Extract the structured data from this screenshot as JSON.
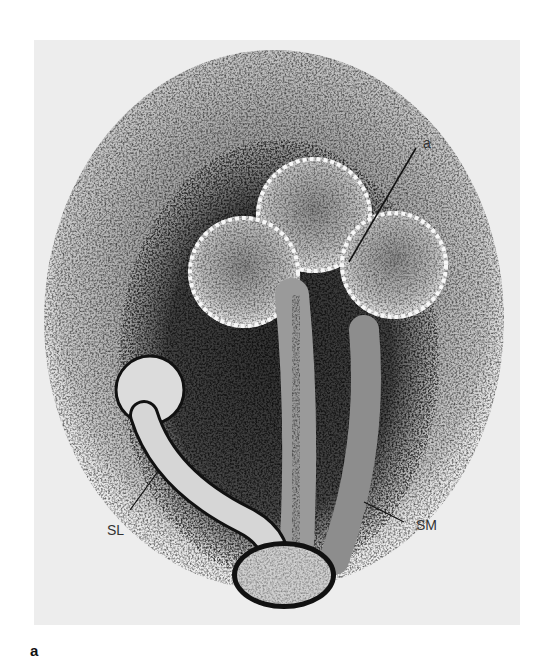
{
  "figure": {
    "type": "micrograph",
    "background_color": "#ededed",
    "stain_color": "#1a1a1a",
    "labels": [
      {
        "id": "a",
        "text": "a"
      },
      {
        "id": "sl",
        "text": "SL"
      },
      {
        "id": "sm",
        "text": "SM"
      }
    ]
  },
  "panel_label": "a"
}
